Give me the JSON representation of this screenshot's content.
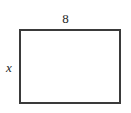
{
  "figure": {
    "kind": "geometry-diagram",
    "shape": "rectangle",
    "background_color": "#ffffff",
    "stroke_color": "#3a3a3a",
    "fill_color": "#ffffff",
    "text_color": "#1f1f1f",
    "labels": {
      "top_side": "8",
      "left_side": "x"
    }
  },
  "chart_data": {
    "type": "diagram",
    "shape": "rectangle",
    "title": "",
    "xlabel": "",
    "ylabel": "",
    "annotations": [
      {
        "name": "top-side-length",
        "text": "8",
        "position": "top",
        "style": "upright"
      },
      {
        "name": "left-side-length",
        "text": "x",
        "position": "left",
        "style": "italic"
      }
    ],
    "dimensions": {
      "width_label": "8",
      "height_label": "x"
    }
  }
}
